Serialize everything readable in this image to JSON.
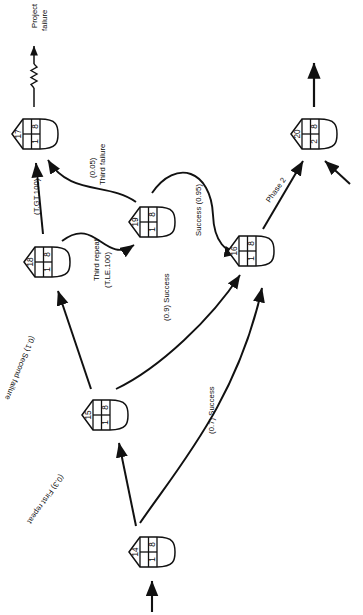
{
  "diagram": {
    "type": "gert-network-diagram",
    "orientation_deg": 90,
    "title_annotation": "Project failure",
    "nodes": [
      {
        "id": "14",
        "number": "14",
        "left_value": "1",
        "right_value": "8",
        "cx": 152,
        "cy": 552
      },
      {
        "id": "15",
        "number": "15",
        "left_value": "1",
        "right_value": "8",
        "cx": 105,
        "cy": 415
      },
      {
        "id": "16",
        "number": "16",
        "left_value": "1",
        "right_value": "8",
        "cx": 251,
        "cy": 251
      },
      {
        "id": "17",
        "number": "17",
        "left_value": "1",
        "right_value": "8",
        "cx": 35,
        "cy": 134
      },
      {
        "id": "18",
        "number": "18",
        "left_value": "1",
        "right_value": "8",
        "cx": 47,
        "cy": 262
      },
      {
        "id": "19",
        "number": "19",
        "left_value": "1",
        "right_value": "8",
        "cx": 152,
        "cy": 222
      },
      {
        "id": "20",
        "number": "20",
        "left_value": "2",
        "right_value": "8",
        "cx": 314,
        "cy": 134
      }
    ],
    "edge_labels": [
      {
        "name": "edge-label-first-repeat",
        "text": "(0.3) First repeat",
        "x": 66,
        "y": 478,
        "rot": 125
      },
      {
        "name": "edge-label-second-failure",
        "text": "(0.1) Second failure",
        "x": 37,
        "y": 338,
        "rot": 112
      },
      {
        "name": "edge-label-t-gt-100",
        "text": "(T.GT.100)",
        "x": 32,
        "y": 215,
        "rot": -90
      },
      {
        "name": "edge-label-third-failure-1",
        "text": "(0.05)",
        "x": 88,
        "y": 178,
        "rot": -90
      },
      {
        "name": "edge-label-third-failure-2",
        "text": "Third failure",
        "x": 98,
        "y": 185,
        "rot": -90
      },
      {
        "name": "edge-label-third-repeat-1",
        "text": "Third repeat",
        "x": 92,
        "y": 281,
        "rot": -90
      },
      {
        "name": "edge-label-third-repeat-2",
        "text": "(T.LE.100)",
        "x": 103,
        "y": 288,
        "rot": -90
      },
      {
        "name": "edge-label-success-095",
        "text": "Success (0.95)",
        "x": 194,
        "y": 236,
        "rot": -90
      },
      {
        "name": "edge-label-success-09",
        "text": "(0.9) Success",
        "x": 162,
        "y": 321,
        "rot": -90
      },
      {
        "name": "edge-label-success-07",
        "text": "(0.7) Success",
        "x": 207,
        "y": 434,
        "rot": -90
      },
      {
        "name": "edge-label-phase-2",
        "text": "Phase 2",
        "x": 264,
        "y": 199,
        "rot": -55
      }
    ],
    "terminal_labels": [
      {
        "name": "terminal-label-project-failure-1",
        "text": "Project",
        "x": 30,
        "y": 28,
        "rot": -90
      },
      {
        "name": "terminal-label-project-failure-2",
        "text": "failure",
        "x": 40,
        "y": 31,
        "rot": -90
      }
    ],
    "colors": {
      "stroke": "#111111",
      "fill": "#ffffff",
      "text": "#0a0a0a"
    }
  }
}
